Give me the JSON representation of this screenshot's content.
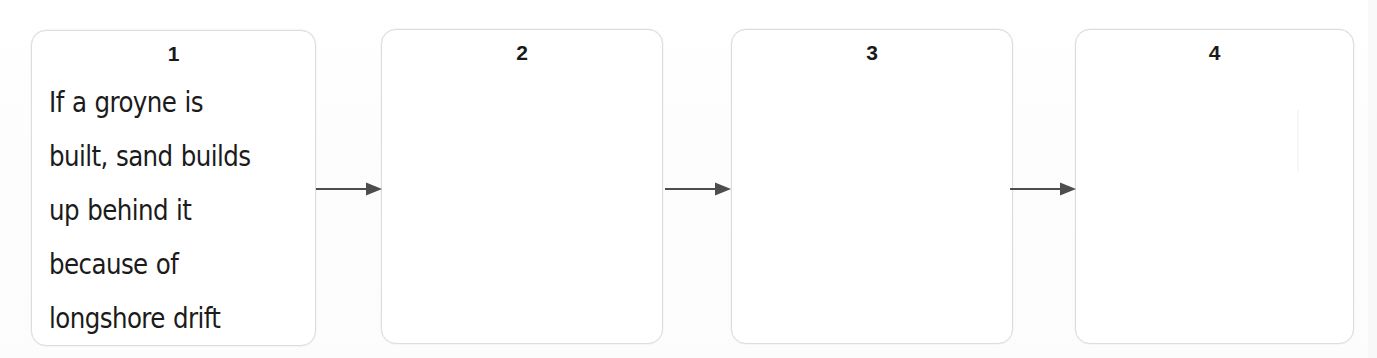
{
  "diagram": {
    "type": "horizontal-flow-chain",
    "background_color": "#fdfdfd",
    "box_border_color": "#dddddd",
    "box_fill_color": "#ffffff",
    "arrow_color": "#4d4d4d",
    "text_color": "#1b1b1b",
    "boxes": [
      {
        "number": "1",
        "text": "If a groyne is\nbuilt, sand builds\nup behind it\nbecause of\nlongshore drift",
        "filled": true,
        "x": 31,
        "y": 30,
        "width": 285,
        "height": 316
      },
      {
        "number": "2",
        "text": "",
        "filled": false,
        "x": 381,
        "y": 29,
        "width": 282,
        "height": 315
      },
      {
        "number": "3",
        "text": "",
        "filled": false,
        "x": 731,
        "y": 29,
        "width": 282,
        "height": 315
      },
      {
        "number": "4",
        "text": "",
        "filled": false,
        "x": 1075,
        "y": 29,
        "width": 279,
        "height": 315
      }
    ],
    "arrows": [
      {
        "label": "arrow-1-to-2",
        "x": 316,
        "y": 178,
        "length": 64
      },
      {
        "label": "arrow-2-to-3",
        "x": 665,
        "y": 178,
        "length": 64
      },
      {
        "label": "arrow-3-to-4",
        "x": 1010,
        "y": 178,
        "length": 64
      }
    ]
  }
}
